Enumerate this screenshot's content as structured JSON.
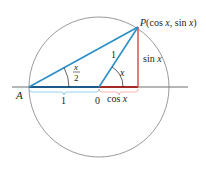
{
  "figure": {
    "point_A": "A",
    "point_P": "P(cos x, sin x)",
    "origin": "0",
    "radius_label": "1",
    "base_label": "1",
    "angle_half_num": "x",
    "angle_half_den": "2",
    "angle_x": "x",
    "sin_label": "sin x",
    "cos_label": "cos x"
  },
  "colors": {
    "circle": "#9a9a9a",
    "axis": "#6d6e71",
    "blue": "#2b8fc6",
    "dark_blue": "#1d5a8a",
    "light_blue_brace": "#7cc4e8",
    "red": "#d9534f",
    "dark_red": "#a42a25",
    "brace_red": "#f0a49c"
  }
}
